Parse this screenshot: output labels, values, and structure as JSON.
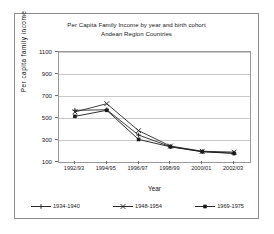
{
  "figure": {
    "title_line1": "Per Capita Family Income by year and birth cohort",
    "title_line2": "Andean Region Countries"
  },
  "chart_data": {
    "type": "line",
    "title": "Per Capita Family Income by year and birth cohort\nAndean Region Countries",
    "subtitle": "Andean Region Countries",
    "xlabel": "Year",
    "ylabel": "Per capita family income",
    "categories": [
      "1992/93",
      "1994/95",
      "1996/97",
      "1998/99",
      "2000/01",
      "2002/03"
    ],
    "ylim": [
      100,
      1100
    ],
    "yticks": [
      100,
      300,
      500,
      700,
      900,
      1100
    ],
    "grid": true,
    "legend_position": "bottom",
    "series": [
      {
        "name": "1934-1940",
        "marker": "plus",
        "color": "#2b2b2b",
        "values": [
          570,
          575,
          345,
          240,
          195,
          180
        ]
      },
      {
        "name": "1948-1954",
        "marker": "x",
        "color": "#2b2b2b",
        "values": [
          555,
          630,
          385,
          245,
          198,
          190
        ]
      },
      {
        "name": "1969-1975",
        "marker": "square",
        "color": "#1a1a1a",
        "values": [
          515,
          570,
          305,
          238,
          193,
          178
        ]
      }
    ]
  }
}
